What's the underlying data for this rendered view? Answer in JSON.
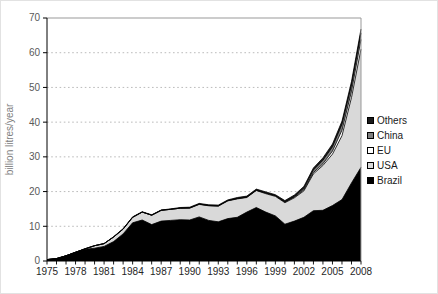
{
  "figure": {
    "background": "#ffffff",
    "frame_color": "#999999",
    "axis_color": "#000000",
    "gridline_color": "#b3b3b3",
    "tick_label_color": "#595959",
    "x_label_color": "#262626",
    "axis_title_color": "#808080"
  },
  "chart_data": {
    "type": "area",
    "stacked": true,
    "title": "",
    "xlabel": "",
    "ylabel": "billion litres/year",
    "ylim": [
      0,
      70
    ],
    "ytick_interval": 10,
    "ytick_labels": [
      "0",
      "10",
      "20",
      "30",
      "40",
      "50",
      "60",
      "70"
    ],
    "grid": "horizontal-dotted",
    "legend_position": "right",
    "legend_order": [
      "Others",
      "China",
      "EU",
      "USA",
      "Brazil"
    ],
    "x": [
      1975,
      1976,
      1977,
      1978,
      1979,
      1980,
      1981,
      1982,
      1983,
      1984,
      1985,
      1986,
      1987,
      1988,
      1989,
      1990,
      1991,
      1992,
      1993,
      1994,
      1995,
      1996,
      1997,
      1998,
      1999,
      2000,
      2001,
      2002,
      2003,
      2004,
      2005,
      2006,
      2007,
      2008
    ],
    "xtick_labels": [
      "1975",
      "1978",
      "1981",
      "1984",
      "1987",
      "1990",
      "1993",
      "1996",
      "1999",
      "2002",
      "2005",
      "2008"
    ],
    "series": [
      {
        "name": "Brazil",
        "color": "#000000",
        "values": [
          0.4,
          0.7,
          1.5,
          2.5,
          3.4,
          3.7,
          4.2,
          5.6,
          7.8,
          11.0,
          11.8,
          10.5,
          11.5,
          11.7,
          11.9,
          11.8,
          12.7,
          11.7,
          11.3,
          12.2,
          12.6,
          14.1,
          15.4,
          14.1,
          13.0,
          10.6,
          11.5,
          12.6,
          14.5,
          14.6,
          16.0,
          17.7,
          22.5,
          27.0
        ]
      },
      {
        "name": "USA",
        "color": "#d9d9d9",
        "values": [
          0,
          0,
          0,
          0,
          0.1,
          0.7,
          0.8,
          1.3,
          1.4,
          1.6,
          2.3,
          2.7,
          3.1,
          3.2,
          3.3,
          3.4,
          3.6,
          4.2,
          4.5,
          5.1,
          5.3,
          4.2,
          4.9,
          5.3,
          5.6,
          6.2,
          6.7,
          7.6,
          10.6,
          12.9,
          14.8,
          18.4,
          24.6,
          34.0
        ]
      },
      {
        "name": "EU",
        "color": "#ffffff",
        "values": [
          0,
          0,
          0,
          0,
          0,
          0,
          0,
          0,
          0,
          0,
          0,
          0,
          0,
          0,
          0,
          0.1,
          0.1,
          0.1,
          0.1,
          0.1,
          0.1,
          0.1,
          0.1,
          0.2,
          0.2,
          0.2,
          0.2,
          0.3,
          0.4,
          0.5,
          0.9,
          1.6,
          1.8,
          2.8
        ]
      },
      {
        "name": "China",
        "color": "#7f7f7f",
        "values": [
          0,
          0,
          0,
          0,
          0,
          0,
          0,
          0,
          0,
          0,
          0,
          0,
          0,
          0,
          0,
          0,
          0,
          0,
          0,
          0,
          0,
          0,
          0,
          0,
          0,
          0,
          0.2,
          0.5,
          0.7,
          1.0,
          1.2,
          1.7,
          1.8,
          1.9
        ]
      },
      {
        "name": "Others",
        "color": "#1a1a1a",
        "values": [
          0,
          0,
          0,
          0,
          0,
          0,
          0,
          0.1,
          0.1,
          0.1,
          0.1,
          0.1,
          0.1,
          0.1,
          0.2,
          0.2,
          0.2,
          0.2,
          0.2,
          0.2,
          0.3,
          0.3,
          0.3,
          0.3,
          0.3,
          0.4,
          0.4,
          0.5,
          0.6,
          0.7,
          0.8,
          0.9,
          1.0,
          1.1
        ]
      }
    ]
  },
  "legend": {
    "items": [
      {
        "label": "Others",
        "color": "#1a1a1a",
        "border": "#000000"
      },
      {
        "label": "China",
        "color": "#7f7f7f",
        "border": "#000000"
      },
      {
        "label": "EU",
        "color": "#ffffff",
        "border": "#000000"
      },
      {
        "label": "USA",
        "color": "#d9d9d9",
        "border": "#000000"
      },
      {
        "label": "Brazil",
        "color": "#000000",
        "border": "#000000"
      }
    ]
  }
}
